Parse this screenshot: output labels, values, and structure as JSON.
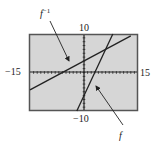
{
  "chart_data": {
    "type": "line",
    "title": "",
    "xlabel": "",
    "ylabel": "",
    "xlim": [
      -15,
      15
    ],
    "ylim": [
      -10,
      10
    ],
    "tick_labels": {
      "xmin": "−15",
      "xmax": "15",
      "ymin": "−10",
      "ymax": "10"
    },
    "grid": false,
    "series": [
      {
        "name": "f",
        "label": "f",
        "equation": "y = 2x - 6",
        "x": [
          -2,
          8
        ],
        "y": [
          -10,
          10
        ]
      },
      {
        "name": "f^-1",
        "label": "f",
        "label_sup": "−1",
        "equation": "y = x/2 + 3",
        "x": [
          -15,
          13
        ],
        "y": [
          -4.5,
          9.5
        ]
      }
    ],
    "annotations": [
      {
        "text": "f⁻¹",
        "points_to": "f^-1 line"
      },
      {
        "text": "f",
        "points_to": "f line"
      }
    ]
  },
  "colors": {
    "screen_bg": "#d6d6d6",
    "border": "#555555",
    "line": "#222222"
  }
}
